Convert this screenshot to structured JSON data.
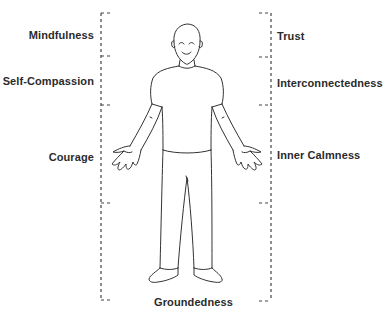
{
  "diagram": {
    "type": "body-map",
    "colors": {
      "line": "#333333",
      "bracket": "#444444",
      "label": "#2b2b2b",
      "background": "#ffffff"
    },
    "left_labels": [
      {
        "label": "Mindfulness",
        "top": 29
      },
      {
        "label": "Self-Compassion",
        "top": 75
      },
      {
        "label": "Courage",
        "top": 151
      }
    ],
    "right_labels": [
      {
        "label": "Trust",
        "top": 30
      },
      {
        "label": "Interconnectedness",
        "top": 77
      },
      {
        "label": "Inner Calmness",
        "top": 149
      }
    ],
    "bottom_label": {
      "label": "Groundedness",
      "top": 296
    },
    "brackets": {
      "left": {
        "x": 101,
        "ticks_y": [
          13,
          56,
          105,
          203,
          300
        ]
      },
      "right": {
        "x": 271,
        "ticks_y": [
          13,
          57,
          105,
          203,
          301
        ]
      }
    }
  }
}
